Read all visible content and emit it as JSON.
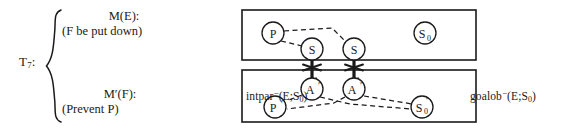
{
  "figure": {
    "type": "diagram",
    "caption": "",
    "background_color": "#ffffff",
    "line_color": "#1a1a1a"
  },
  "formula": {
    "trial_label": "T",
    "trial_subscript": "7",
    "trial_colon": ":",
    "branches": [
      {
        "id": "branch-top",
        "head": "M(E):",
        "body": "(F be put down)"
      },
      {
        "id": "branch-bottom",
        "head": "M′(F):",
        "body": "(Prevent P)"
      }
    ],
    "brace": "{"
  },
  "diagram": {
    "boxes": [
      {
        "id": "upper-box",
        "x": 12,
        "y": 10,
        "w": 234,
        "h": 50
      },
      {
        "id": "lower-box",
        "x": 12,
        "y": 70,
        "w": 234,
        "h": 52
      }
    ],
    "nodes": [
      {
        "id": "node-p",
        "label": "P",
        "sup": "",
        "sub": "",
        "cx": 43,
        "cy": 33,
        "r": 11,
        "box": "upper"
      },
      {
        "id": "node-s-left",
        "label": "S",
        "sup": "",
        "sub": "",
        "cx": 82,
        "cy": 49,
        "r": 11,
        "box": "upper"
      },
      {
        "id": "node-s-right",
        "label": "S",
        "sup": "",
        "sub": "",
        "cx": 124,
        "cy": 49,
        "r": 11,
        "box": "upper"
      },
      {
        "id": "node-s0",
        "label": "S",
        "sup": "",
        "sub": "0",
        "cx": 195,
        "cy": 33,
        "r": 11,
        "box": "upper"
      },
      {
        "id": "node-a-left",
        "label": "A",
        "sup": "′",
        "sub": "",
        "cx": 82,
        "cy": 89,
        "r": 11,
        "box": "lower"
      },
      {
        "id": "node-a-right",
        "label": "A",
        "sup": "′",
        "sub": "",
        "cx": 124,
        "cy": 89,
        "r": 11,
        "box": "lower"
      },
      {
        "id": "node-p-prime",
        "label": "P",
        "sup": "′",
        "sub": "",
        "cx": 45,
        "cy": 107,
        "r": 11,
        "box": "lower"
      },
      {
        "id": "node-s0-prime",
        "label": "S",
        "sup": "′",
        "sub": "0",
        "cx": 192,
        "cy": 107,
        "r": 11,
        "box": "lower"
      }
    ],
    "dashed_edges": [
      {
        "id": "edge-p-s0bend",
        "from": "node-p",
        "to": "node-s-right"
      },
      {
        "id": "edge-p-sleft",
        "from": "node-p",
        "to": "node-s-left"
      },
      {
        "id": "edge-aleft-pp",
        "from": "node-a-left",
        "to": "node-p-prime"
      },
      {
        "id": "edge-aleft-mid",
        "from": "node-a-left",
        "to": "node-s0-prime"
      },
      {
        "id": "edge-aright-mid",
        "from": "node-a-right",
        "to": "node-p-prime"
      },
      {
        "id": "edge-aright-s0p",
        "from": "node-a-right",
        "to": "node-s0-prime"
      }
    ],
    "arrows": [
      {
        "id": "arrow-left",
        "from": "node-s-left",
        "to": "node-a-left",
        "marker": "star"
      },
      {
        "id": "arrow-right",
        "from": "node-s-right",
        "to": "node-a-right",
        "marker": "star"
      }
    ],
    "labels": {
      "left": {
        "id": "label-intpar",
        "name": "intpar",
        "superscript": "−",
        "args": "(E;S",
        "arg_sub": "0",
        "args_close": ")"
      },
      "right": {
        "id": "label-goalob",
        "name": "goalob",
        "superscript": "−",
        "args": "(E;S",
        "arg_sub": "0",
        "args_close": ")"
      }
    }
  }
}
